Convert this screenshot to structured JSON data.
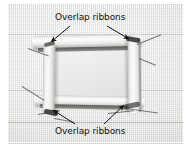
{
  "figure": {
    "kind": "photograph-with-callouts",
    "background_color": "#e4e4e2",
    "annotation_color": "#111111"
  },
  "annotations": {
    "top": {
      "label": "Overlap ribbons",
      "arrows": [
        {
          "name": "arrow-top-left",
          "direction": "down-left",
          "target": "top-left-overlap-corner"
        },
        {
          "name": "arrow-top-right",
          "direction": "down-right",
          "target": "top-right-overlap-corner"
        }
      ]
    },
    "bottom": {
      "label": "Overlap ribbons",
      "arrows": [
        {
          "name": "arrow-bottom-left",
          "direction": "up-left",
          "target": "bottom-left-overlap-corner"
        },
        {
          "name": "arrow-bottom-right",
          "direction": "up-right",
          "target": "bottom-right-overlap-corner"
        }
      ]
    }
  },
  "structure": {
    "ribbons": [
      {
        "name": "ribbon-top",
        "orientation": "horizontal"
      },
      {
        "name": "ribbon-bottom",
        "orientation": "horizontal"
      },
      {
        "name": "ribbon-left",
        "orientation": "vertical"
      },
      {
        "name": "ribbon-right",
        "orientation": "vertical"
      }
    ],
    "corners": [
      "top-left-overlap-corner",
      "top-right-overlap-corner",
      "bottom-left-overlap-corner",
      "bottom-right-overlap-corner"
    ]
  }
}
